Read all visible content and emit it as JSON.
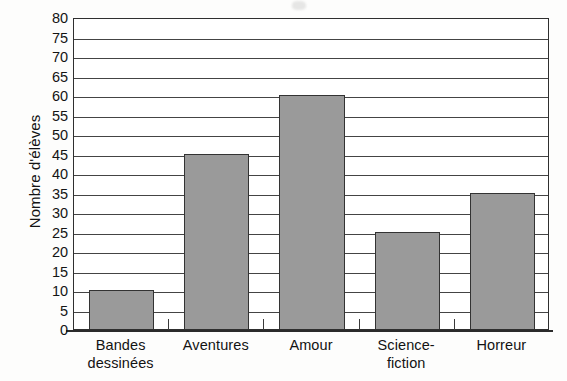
{
  "chart_data": {
    "type": "bar",
    "title": "",
    "xlabel": "",
    "ylabel": "Nombre d'élèves",
    "categories": [
      "Bandes dessinées",
      "Aventures",
      "Amour",
      "Science-fiction",
      "Horreur"
    ],
    "category_lines": [
      [
        "Bandes",
        "dessinées"
      ],
      [
        "Aventures"
      ],
      [
        "Amour"
      ],
      [
        "Science-",
        "fiction"
      ],
      [
        "Horreur"
      ]
    ],
    "values": [
      10,
      45,
      60,
      25,
      35
    ],
    "ylim": [
      0,
      80
    ],
    "ytick_step": 5,
    "yticks": [
      0,
      5,
      10,
      15,
      20,
      25,
      30,
      35,
      40,
      45,
      50,
      55,
      60,
      65,
      70,
      75,
      80
    ],
    "ytick_labels": [
      "0",
      "5",
      "10",
      "15",
      "20",
      "25",
      "30",
      "35",
      "40",
      "45",
      "50",
      "55",
      "60",
      "65",
      "70",
      "75",
      "80"
    ],
    "grid": true,
    "grid_orientation": "horizontal",
    "legend": false,
    "legend_position": "none",
    "bar_color": "#9a9a9a",
    "bar_edge_color": "#333333",
    "axis_color": "#2f2f2f",
    "grid_color": "#444444",
    "background_color": "#fdfdfc",
    "plot_background_color": "#ffffff"
  },
  "axes": {
    "y_title": "Nombre d'élèves",
    "zero_label": "0"
  }
}
